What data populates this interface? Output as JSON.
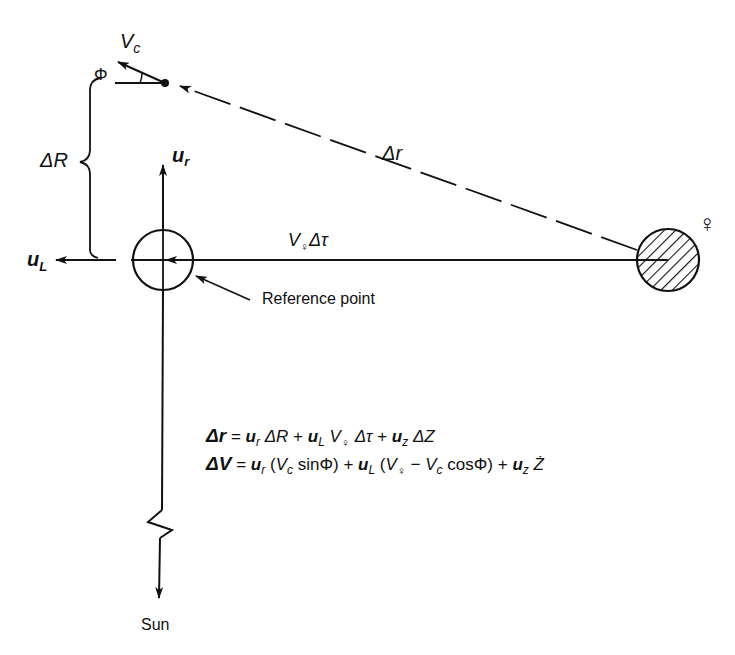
{
  "diagram": {
    "labels": {
      "vc": "V",
      "vc_sub": "c",
      "phi": "Φ",
      "delta_R": "ΔR",
      "delta_r": "Δr",
      "ur": "u",
      "ur_sub": "r",
      "uL": "u",
      "uL_sub": "L",
      "v_venus_dtau": "V",
      "v_venus_dtau_rest": "Δτ",
      "venus_symbol": "♀",
      "reference_point": "Reference point",
      "sun": "Sun"
    },
    "equations": {
      "eq1": {
        "lhs": "Δr",
        "rhs": "= u_r ΔR + u_L V♀ Δτ + u_z ΔZ"
      },
      "eq2": {
        "lhs": "ΔV",
        "rhs": "= u_r (V_c sinΦ) + u_L (V♀ − V_c cosΦ) + u_z Ż"
      }
    },
    "colors": {
      "ink": "#111111",
      "background": "#ffffff"
    }
  }
}
